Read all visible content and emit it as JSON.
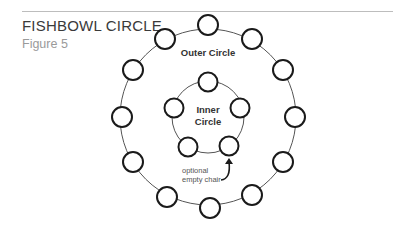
{
  "header": {
    "title": "FISHBOWL CIRCLE",
    "subtitle": "Figure 5"
  },
  "diagram": {
    "outer_label": "Outer Circle",
    "inner_label_line1": "Inner",
    "inner_label_line2": "Circle",
    "annotation_line1": "optional",
    "annotation_line2": "empty chair",
    "outer_ring": {
      "cx": 208,
      "cy": 117,
      "r": 88
    },
    "inner_ring": {
      "cx": 208,
      "cy": 117,
      "r": 36
    },
    "outer_chairs": [
      {
        "x": 208,
        "y": 25
      },
      {
        "x": 252,
        "y": 39
      },
      {
        "x": 283,
        "y": 70
      },
      {
        "x": 295,
        "y": 117
      },
      {
        "x": 283,
        "y": 162
      },
      {
        "x": 252,
        "y": 195
      },
      {
        "x": 210,
        "y": 208
      },
      {
        "x": 167,
        "y": 197
      },
      {
        "x": 133,
        "y": 162
      },
      {
        "x": 122,
        "y": 117
      },
      {
        "x": 133,
        "y": 70
      },
      {
        "x": 165,
        "y": 39
      }
    ],
    "inner_chairs": [
      {
        "x": 208,
        "y": 82
      },
      {
        "x": 240,
        "y": 108
      },
      {
        "x": 229,
        "y": 146
      },
      {
        "x": 188,
        "y": 147
      },
      {
        "x": 174,
        "y": 108
      }
    ],
    "colors": {
      "stroke": "#1a1a1a",
      "ring": "#555555",
      "label": "#333333",
      "annotation": "#555555"
    }
  }
}
